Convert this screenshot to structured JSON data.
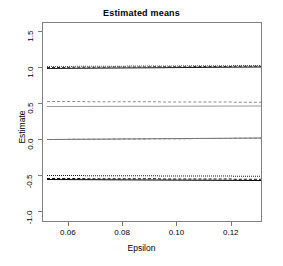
{
  "chart_data": {
    "type": "line",
    "title": "Estimated means",
    "xlabel": "Epsilon",
    "ylabel": "Estimate",
    "xlim": [
      0.0505,
      0.1315
    ],
    "ylim": [
      -1.15,
      1.62
    ],
    "grid": false,
    "legend": "none",
    "xticks": [
      0.06,
      0.08,
      0.1,
      0.12
    ],
    "xticklabels": [
      "0.06",
      "0.08",
      "0.10",
      "0.12"
    ],
    "yticks": [
      -1.0,
      -0.5,
      0.0,
      0.5,
      1.0,
      1.5
    ],
    "yticklabels": [
      "-1.0",
      "-0.5",
      "0.0",
      "0.5",
      "1.0",
      "1.5"
    ],
    "x": [
      0.052,
      0.131
    ],
    "series": [
      {
        "name": "group1-solid-black",
        "values": [
          1.0,
          1.02
        ],
        "style": "solid",
        "color": "#1a1a1a",
        "width": 1.6
      },
      {
        "name": "group1-dashed-black",
        "values": [
          1.012,
          1.03
        ],
        "style": "dashed",
        "color": "#2b2b2b",
        "width": 1.6
      },
      {
        "name": "group1-dotted-grey",
        "values": [
          1.022,
          1.036
        ],
        "style": "dotted",
        "color": "#555555",
        "width": 1.0
      },
      {
        "name": "group2-dashed-grey",
        "values": [
          0.54,
          0.53
        ],
        "style": "dashed",
        "color": "#8c8c8c",
        "width": 1.6
      },
      {
        "name": "group2-solid-grey",
        "values": [
          0.472,
          0.478
        ],
        "style": "solid",
        "color": "#9a9a9a",
        "width": 1.2
      },
      {
        "name": "group3-solid-grey",
        "values": [
          0.008,
          0.028
        ],
        "style": "solid",
        "color": "#6e6e6e",
        "width": 1.2
      },
      {
        "name": "group3-dashed-grey",
        "values": [
          0.016,
          0.034
        ],
        "style": "dashed",
        "color": "#7d7d7d",
        "width": 1.4
      },
      {
        "name": "group4-dotted-black",
        "values": [
          -0.482,
          -0.492
        ],
        "style": "dotted",
        "color": "#1a1a1a",
        "width": 1.2
      },
      {
        "name": "group4-dashed-black",
        "values": [
          -0.522,
          -0.532
        ],
        "style": "dashed",
        "color": "#111111",
        "width": 1.6
      },
      {
        "name": "group4-solid-black",
        "values": [
          -0.534,
          -0.548
        ],
        "style": "solid",
        "color": "#000000",
        "width": 1.8
      }
    ]
  }
}
